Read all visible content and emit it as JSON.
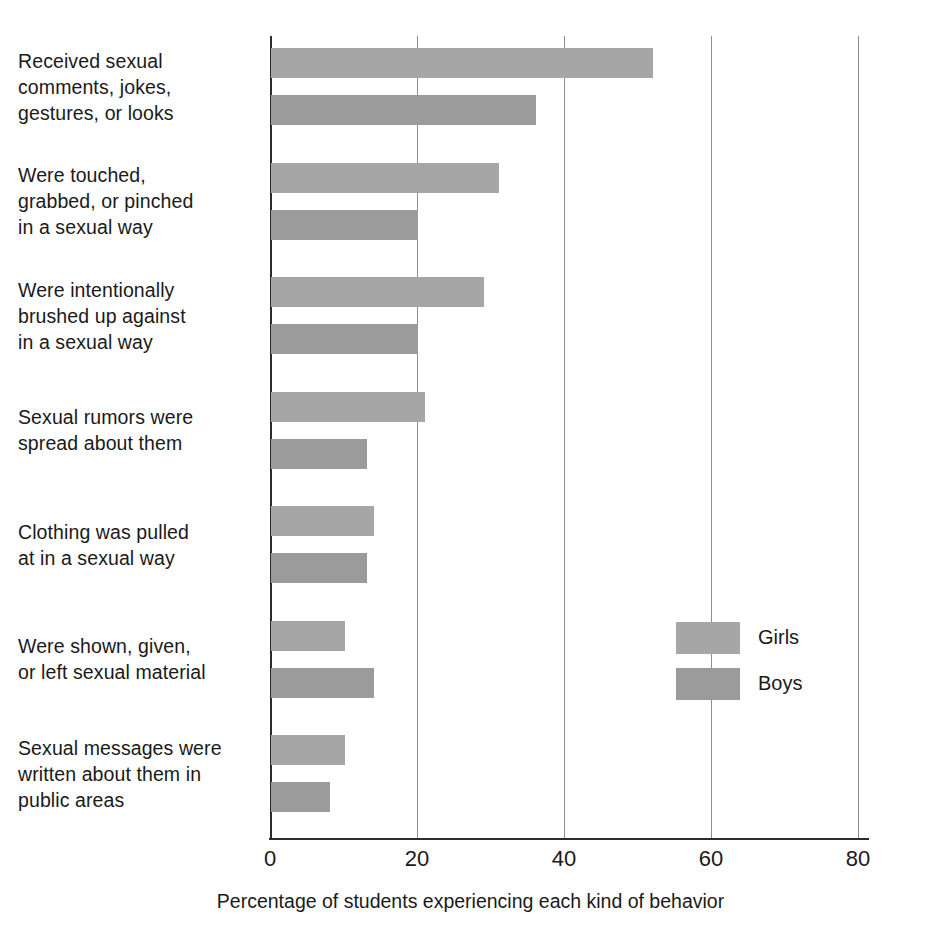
{
  "chart_data": {
    "type": "bar",
    "orientation": "horizontal",
    "title": "",
    "xlabel": "Percentage of students experiencing each kind of behavior",
    "ylabel": "",
    "xlim": [
      0,
      80
    ],
    "xticks": [
      0,
      20,
      40,
      60,
      80
    ],
    "xtick_labels": [
      "0",
      "20",
      "40",
      "60",
      "80"
    ],
    "grid": "vertical",
    "legend_position": "middle-right",
    "categories": [
      "Received sexual comments, jokes, gestures, or looks",
      "Were touched, grabbed, or pinched in a sexual way",
      "Were intentionally brushed up against in a sexual way",
      "Sexual rumors were spread about them",
      "Clothing was pulled at in a sexual way",
      "Were shown, given, or left sexual material",
      "Sexual messages were written about them in public areas"
    ],
    "category_lines": [
      [
        "Received sexual",
        "comments, jokes,",
        "gestures, or looks"
      ],
      [
        "Were touched,",
        "grabbed, or pinched",
        "in a sexual way"
      ],
      [
        "Were intentionally",
        "brushed up against",
        "in a sexual way"
      ],
      [
        "Sexual rumors were",
        "spread about them"
      ],
      [
        "Clothing was pulled",
        "at in a sexual way"
      ],
      [
        "Were shown, given,",
        "or left sexual material"
      ],
      [
        "Sexual messages were",
        "written about them in",
        "public areas"
      ]
    ],
    "series": [
      {
        "name": "Girls",
        "color": "#a6a6a6",
        "values": [
          52,
          31,
          29,
          21,
          14,
          10,
          10
        ]
      },
      {
        "name": "Boys",
        "color": "#9b9b9b",
        "values": [
          36,
          20,
          20,
          13,
          13,
          14,
          8
        ]
      }
    ]
  },
  "legend": {
    "items": [
      {
        "label": "Girls",
        "color": "#a6a6a6"
      },
      {
        "label": "Boys",
        "color": "#9b9b9b"
      }
    ]
  },
  "axis": {
    "x_title": "Percentage of students experiencing each kind of behavior",
    "tick_0": "0",
    "tick_20": "20",
    "tick_40": "40",
    "tick_60": "60",
    "tick_80": "80"
  },
  "colors": {
    "girls_bar": "#a6a6a6",
    "boys_bar": "#9b9b9b",
    "axis": "#2b2b2b",
    "gridline": "#8e8e8e",
    "text": "#1a1a1a",
    "background": "#ffffff"
  }
}
